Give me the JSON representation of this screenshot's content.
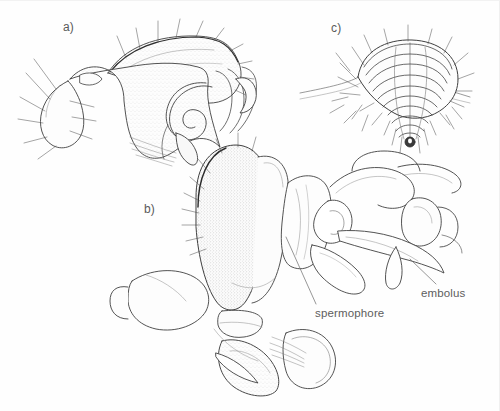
{
  "figure": {
    "kind": "scientific-line-drawing",
    "background_color": "#ffffff",
    "ink_color": "#3a3a3a",
    "label_color": "#5d5d5d",
    "fill_color": "#fbfbfb",
    "stipple_color": "#8a8a8a",
    "width": 500,
    "height": 411
  },
  "panels": [
    {
      "id": "a",
      "label": "a)",
      "description": "lateral view of male palpal organ with coiled embolus and retrolateral tibial apophysis, setae along margin"
    },
    {
      "id": "b",
      "label": "b)",
      "description": "expanded palpal bulb with spermophore and embolus, femur and patella below"
    },
    {
      "id": "c",
      "label": "c)",
      "description": "ventral view of epigyne, ribbed funnel-shaped structure surrounded by radiating setae"
    }
  ],
  "callouts": [
    {
      "id": "spermophore",
      "label": "spermophore",
      "leader": {
        "from_x": 286,
        "from_y": 236,
        "to_x": 316,
        "to_y": 303
      }
    },
    {
      "id": "embolus",
      "label": "embolus",
      "leader": {
        "from_x": 410,
        "from_y": 258,
        "to_x": 436,
        "to_y": 283
      }
    }
  ]
}
